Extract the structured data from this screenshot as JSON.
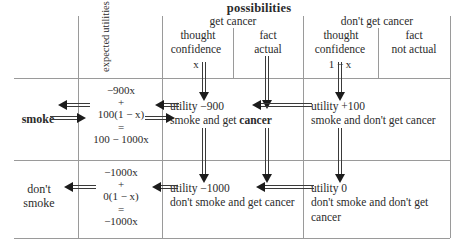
{
  "title": "possibilities",
  "headers": {
    "expected_utilities": [
      "expected",
      "utilities"
    ],
    "groups": [
      {
        "label": "get cancer",
        "columns": [
          {
            "line1": "thought",
            "line2": "confidence",
            "probability": "x"
          },
          {
            "line1": "fact",
            "line2": "actual",
            "probability": ""
          }
        ]
      },
      {
        "label": "don't get cancer",
        "columns": [
          {
            "line1": "thought",
            "line2": "confidence",
            "probability": "1 − x"
          },
          {
            "line1": "fact",
            "line2": "not actual",
            "probability": ""
          }
        ]
      }
    ]
  },
  "rows": [
    {
      "label": "smoke",
      "label_bold": true,
      "expected_utility": {
        "term1": "−900x",
        "operator": "+",
        "term2": "100(1 − x)",
        "equals": "=",
        "result": "100 − 1000x"
      },
      "cells": [
        {
          "utility_line": "utility −900",
          "desc_pre": "smoke and get ",
          "desc_bold": "cancer",
          "desc_post": ""
        },
        {
          "utility_line": "utility +100",
          "desc_pre": "smoke and don't get cancer",
          "desc_bold": "",
          "desc_post": ""
        }
      ]
    },
    {
      "label": "don't smoke",
      "label_bold": false,
      "label_lines": [
        "don't",
        "smoke"
      ],
      "expected_utility": {
        "term1": "−1000x",
        "operator": "+",
        "term2": "0(1 − x)",
        "equals": "=",
        "result": "−1000x"
      },
      "cells": [
        {
          "utility_line": "utility −1000",
          "desc_pre": "don't smoke and get cancer",
          "desc_bold": "",
          "desc_post": ""
        },
        {
          "utility_line": "utility 0",
          "desc_pre": "don't smoke and don't get cancer",
          "desc_bold": "",
          "desc_post": ""
        }
      ]
    }
  ],
  "colors": {
    "rule": "#9a9a9a",
    "text": "#2b2b2b",
    "arrow": "#1c1c1c",
    "background": "#ffffff"
  }
}
